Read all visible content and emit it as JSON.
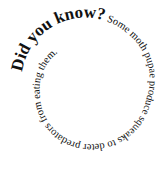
{
  "spiral": {
    "headline": "Did you know?",
    "body": " Some moth pupae produce squeaks to deter predators from eating them.",
    "full_text": "Did you know? Some moth pupae produce squeaks to deter predators from eating them.",
    "text_color": "#111111",
    "background_color": "#ffffff"
  }
}
